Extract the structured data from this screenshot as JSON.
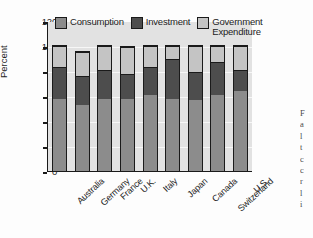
{
  "chart_data": {
    "type": "bar",
    "subtype": "stacked-bar",
    "title": "",
    "xlabel": "",
    "ylabel": "Percent",
    "ylim": [
      0,
      120
    ],
    "yticks": [
      0,
      20,
      40,
      60,
      80,
      100,
      120
    ],
    "ytick_labels": [
      "0",
      "20",
      "40",
      "60",
      "80",
      "100",
      "120"
    ],
    "grid": true,
    "legend_position": "top-inside",
    "categories": [
      "Australia",
      "Germany",
      "France",
      "U.K.",
      "Italy",
      "Japan",
      "Canada",
      "Switzerland",
      "U.S."
    ],
    "series": [
      {
        "name": "Consumption",
        "color": "#8c8c8c",
        "values": [
          58,
          53,
          58,
          58,
          61,
          58,
          57,
          61,
          64
        ]
      },
      {
        "name": "Investment",
        "color": "#4d4d4d",
        "values": [
          25,
          23,
          23,
          20,
          22,
          32,
          22,
          26,
          17
        ]
      },
      {
        "name": "Government Expenditure",
        "color": "#c4c4c4",
        "values": [
          17,
          19,
          19,
          21,
          17,
          10,
          21,
          13,
          19
        ]
      }
    ],
    "cumulative_tops": {
      "consumption": [
        58,
        53,
        58,
        58,
        61,
        58,
        57,
        61,
        64
      ],
      "investment": [
        83,
        76,
        81,
        78,
        83,
        90,
        79,
        87,
        81
      ],
      "government": [
        100,
        95,
        100,
        99,
        100,
        100,
        100,
        100,
        100
      ]
    }
  },
  "legend": {
    "items": [
      {
        "label": "Consumption",
        "color": "#8c8c8c"
      },
      {
        "label": "Investment",
        "color": "#4d4d4d"
      },
      {
        "label": "Government\nExpenditure",
        "color": "#c4c4c4"
      }
    ]
  },
  "axes": {
    "y_title": "Percent"
  },
  "edge_text": {
    "lines": [
      "F",
      "a",
      "l",
      "t",
      "c",
      "c",
      "r",
      "l",
      "i"
    ]
  }
}
